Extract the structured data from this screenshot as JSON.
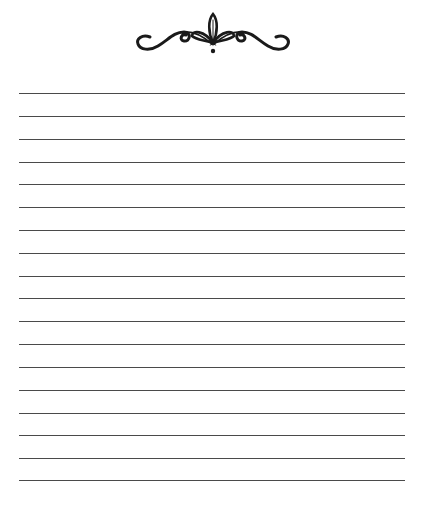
{
  "page": {
    "type": "blank lined writing page",
    "background": "#ffffff",
    "line_color": "#4a4a4a",
    "ornament": {
      "icon": "flourish-divider-icon",
      "color": "#1a1a1a"
    },
    "lines": {
      "count": 18,
      "left": 19,
      "right": 405,
      "y_positions": [
        93,
        116,
        139,
        162,
        184,
        207,
        230,
        253,
        276,
        298,
        321,
        344,
        367,
        390,
        413,
        435,
        458,
        480
      ]
    }
  }
}
